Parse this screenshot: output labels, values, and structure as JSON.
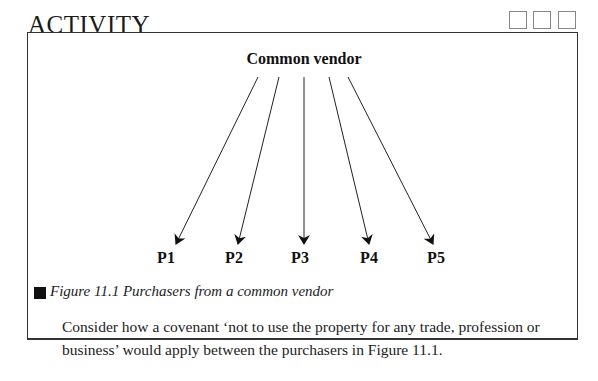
{
  "activity": {
    "heading": "ACTIVITY",
    "checkboxes": [
      {
        "checked": false
      },
      {
        "checked": false
      },
      {
        "checked": false
      }
    ]
  },
  "figure": {
    "vendor_label": "Common vendor",
    "purchasers": [
      "P1",
      "P2",
      "P3",
      "P4",
      "P5"
    ],
    "caption": "Figure 11.1 Purchasers from a common vendor"
  },
  "body": {
    "text": "Consider how a covenant ‘not to use the property for any trade, profession or business’ would apply between the purchasers in Figure 11.1."
  }
}
